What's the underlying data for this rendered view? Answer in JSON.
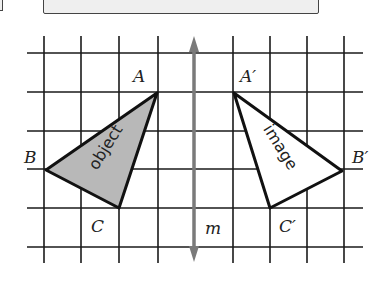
{
  "diagram": {
    "type": "reflection-on-grid",
    "grid": {
      "vertical_lines_x": [
        44,
        81,
        119,
        158,
        233,
        270,
        307,
        344
      ],
      "horizontal_lines_y": [
        53,
        92,
        131,
        169,
        208,
        247
      ],
      "color": "#1a1a1a"
    },
    "mirror_line": {
      "label": "m",
      "x": 194,
      "y_top": 36,
      "y_bottom": 262,
      "color": "#7a7a7a"
    },
    "object_triangle": {
      "text": "object",
      "fill": "#b8b8b8",
      "vertices": {
        "A": {
          "label": "A",
          "x": 157,
          "y": 93
        },
        "B": {
          "label": "B",
          "x": 46,
          "y": 170
        },
        "C": {
          "label": "C",
          "x": 119,
          "y": 208
        }
      }
    },
    "image_triangle": {
      "text": "image",
      "fill": "#ffffff",
      "vertices": {
        "A": {
          "label": "A′",
          "x": 234,
          "y": 93
        },
        "B": {
          "label": "B′",
          "x": 342,
          "y": 171
        },
        "C": {
          "label": "C′",
          "x": 270,
          "y": 208
        }
      }
    }
  }
}
